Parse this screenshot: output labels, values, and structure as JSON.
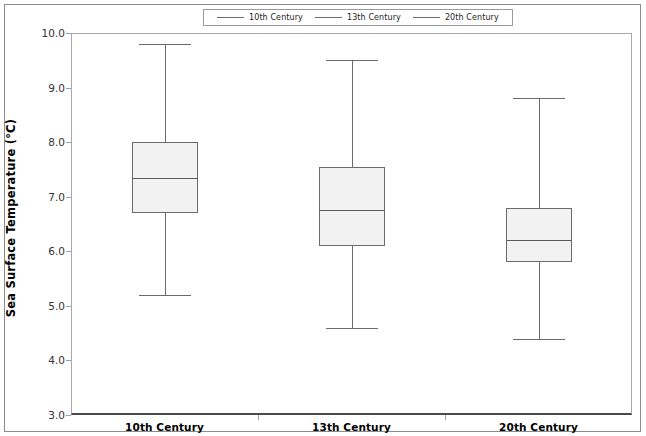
{
  "chart_data": {
    "type": "box",
    "title": "",
    "xlabel": "",
    "ylabel": "Sea Surface Temperature (°C)",
    "ylim": [
      3.0,
      10.0
    ],
    "ytick_labels": [
      "10.0",
      "9.0",
      "8.0",
      "7.0",
      "6.0",
      "5.0",
      "4.0",
      "3.0"
    ],
    "ytick_values": [
      10.0,
      9.0,
      8.0,
      7.0,
      6.0,
      5.0,
      4.0,
      3.0
    ],
    "grid": false,
    "legend_position": "top-center",
    "categories": [
      "10th Century",
      "13th Century",
      "20th Century"
    ],
    "legend": [
      "10th Century",
      "13th Century",
      "20th Century"
    ],
    "boxes": [
      {
        "name": "10th Century",
        "whisker_low": 5.2,
        "q1": 6.7,
        "median": 7.35,
        "q3": 8.0,
        "whisker_high": 9.8
      },
      {
        "name": "13th Century",
        "whisker_low": 4.6,
        "q1": 6.1,
        "median": 6.75,
        "q3": 7.55,
        "whisker_high": 9.5
      },
      {
        "name": "20th Century",
        "whisker_low": 4.4,
        "q1": 5.8,
        "median": 6.2,
        "q3": 6.8,
        "whisker_high": 8.8
      }
    ],
    "colors": {
      "box_fill": "#f2f2f2",
      "box_edge": "#6b6b6b",
      "median_line": "#5a5a5a",
      "axis": "#4a4a4a",
      "frame": "#8c8c8c"
    }
  }
}
